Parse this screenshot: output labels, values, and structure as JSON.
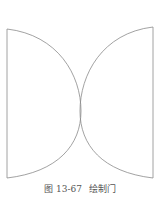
{
  "figure": {
    "caption_number": "图 13-67",
    "caption_title": "绘制门",
    "line_color": "#8a8a8a",
    "doors": [
      {
        "name": "left-door",
        "hinge_x": 7,
        "top_y": 29,
        "bottom_y": 178,
        "arc_peak_x": 81
      },
      {
        "name": "right-door",
        "hinge_x": 153,
        "top_y": 27,
        "bottom_y": 178,
        "arc_peak_x": 80
      }
    ]
  }
}
